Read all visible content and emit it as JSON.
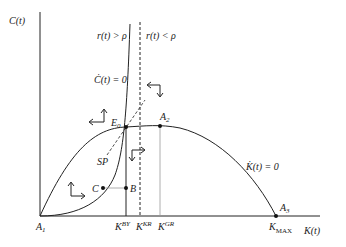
{
  "diagram": {
    "type": "phase-diagram",
    "axes": {
      "y_label": "C(t)",
      "x_label": "K(t)"
    },
    "regions": {
      "left": "r(t) > ρ",
      "right": "r(t) < ρ"
    },
    "curves": {
      "c_dot": "Ċ(t) = 0",
      "k_dot": "K̇(t) = 0",
      "saddle_path": "SP"
    },
    "points": {
      "E0": {
        "base": "E",
        "sub": "0"
      },
      "A1": {
        "base": "A",
        "sub": "1"
      },
      "A2": {
        "base": "A",
        "sub": "2"
      },
      "A3": {
        "base": "A",
        "sub": "3"
      },
      "B": "B",
      "C": "C"
    },
    "x_ticks": [
      {
        "base": "K",
        "sup": "BY"
      },
      {
        "base": "K",
        "sup": "KR"
      },
      {
        "base": "K",
        "sup": "GR"
      },
      {
        "base": "K",
        "sub": "MAX"
      }
    ]
  }
}
